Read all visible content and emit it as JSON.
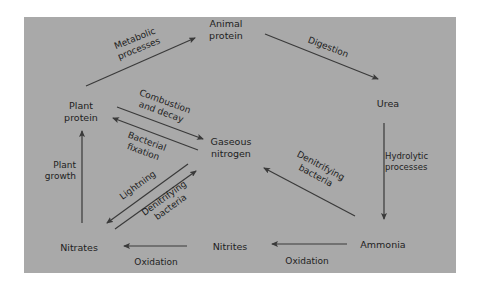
{
  "diagram": {
    "type": "cycle",
    "background_color": "#a9a9a9",
    "text_color": "#1e1e1e",
    "arrow_color": "#3a3a3a",
    "nodes": {
      "animal_protein": {
        "line1": "Animal",
        "line2": "protein"
      },
      "urea": {
        "line1": "Urea"
      },
      "plant_protein": {
        "line1": "Plant",
        "line2": "protein"
      },
      "gaseous_nitrogen": {
        "line1": "Gaseous",
        "line2": "nitrogen"
      },
      "nitrates": {
        "line1": "Nitrates"
      },
      "nitrites": {
        "line1": "Nitrites"
      },
      "ammonia": {
        "line1": "Ammonia"
      }
    },
    "edges": {
      "metabolic": {
        "from": "Plant protein",
        "to": "Animal protein",
        "line1": "Metabolic",
        "line2": "processes"
      },
      "digestion": {
        "from": "Animal protein",
        "to": "Urea",
        "line1": "Digestion"
      },
      "hydrolytic": {
        "from": "Urea",
        "to": "Ammonia",
        "line1": "Hydrolytic",
        "line2": "processes"
      },
      "denitrifying_right": {
        "from": "Ammonia",
        "to": "Gaseous nitrogen",
        "line1": "Denitrifying",
        "line2": "bacteria"
      },
      "oxidation_right": {
        "from": "Ammonia",
        "to": "Nitrites",
        "line1": "Oxidation"
      },
      "oxidation_left": {
        "from": "Nitrites",
        "to": "Nitrates",
        "line1": "Oxidation"
      },
      "plant_growth": {
        "from": "Nitrates",
        "to": "Plant protein",
        "line1": "Plant",
        "line2": "growth"
      },
      "combustion": {
        "from": "Plant protein",
        "to": "Gaseous nitrogen",
        "line1": "Combustion",
        "line2": "and decay"
      },
      "bacterial_fixation": {
        "from": "Gaseous nitrogen",
        "to": "Plant protein",
        "line1": "Bacterial",
        "line2": "fixation"
      },
      "lightning": {
        "from": "Gaseous nitrogen",
        "to": "Nitrates",
        "line1": "Lightning"
      },
      "denitrifying_left": {
        "from": "Nitrates",
        "to": "Gaseous nitrogen",
        "line1": "Denitrifying",
        "line2": "bacteria"
      }
    }
  }
}
